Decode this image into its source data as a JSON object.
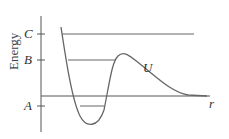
{
  "diagram": {
    "ylabel": "Energy",
    "xlabel": "r",
    "curve_label": "U",
    "levels": [
      {
        "name": "C",
        "label": "C"
      },
      {
        "name": "B",
        "label": "B"
      },
      {
        "name": "A",
        "label": "A"
      }
    ],
    "colors": {
      "line": "#555555",
      "curve": "#666666",
      "text": "#333333"
    }
  }
}
